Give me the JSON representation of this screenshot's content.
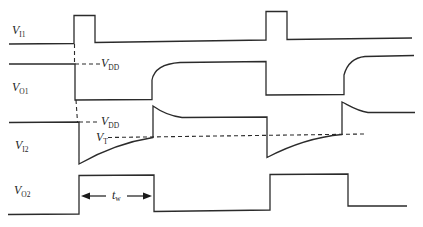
{
  "diagram": {
    "title": ""
  },
  "labels": {
    "vi1": {
      "main": "V",
      "sub": "I1"
    },
    "vo1": {
      "main": "V",
      "sub": "O1"
    },
    "vdd_1": {
      "main": "V",
      "sub": "DD"
    },
    "vi2": {
      "main": "V",
      "sub": "I2"
    },
    "vdd_2": {
      "main": "V",
      "sub": "DD"
    },
    "vt": {
      "main": "V",
      "sub": "T"
    },
    "vo2": {
      "main": "V",
      "sub": "O2"
    },
    "tw": {
      "main": "t",
      "sub": "w"
    }
  },
  "waveforms": {
    "vi1": {
      "path": "M9,44 L74,43.5 L74,15.5 L95,15.5 L95,42.5 L266,40 L266,11.5 L287,11.5 L287,39.5 L412,38"
    },
    "vo1": {
      "path": "M9,64 L75,64 L75,100 L152,99.5 L152,80 C154,69 164,63.5 180,62.5 L266,61.5 L266,95 L344,94.5 L344,75 C347,64 354,57.5 365,56.5 L414,55.5"
    },
    "vi2": {
      "path": "M9,122.5 L79,122 L79,164 C100,152 124,142 153,137.5 L153,106 C160,111 170,116 182,117.5 L267,117 L267,157.5 C289,146 314,137 342,134.5 L342,102 C350,106 357,111 368,112.5 L415,112.5"
    },
    "vo2": {
      "path": "M8,214.5 L79,214 L79,175.5 L154,175 L154,211.5 L270,210 L270,174.5 L348,174 L348,206 L407,206"
    }
  },
  "reference_lines": {
    "trigger_vertical_upper": {
      "path": "M74.5,44 L74.5,64"
    },
    "trigger_vertical_lower": {
      "path": "M76,100 L77.5,122"
    },
    "vdd_level_1": {
      "path": "M75,64 L100,64"
    },
    "vdd_level_2": {
      "path": "M79,122 L100,122"
    },
    "vt_threshold": {
      "path": "M108,137.5 L365,134"
    }
  },
  "tw_dimension": {
    "left_line": {
      "path": "M88,196 L106,196"
    },
    "left_head": {
      "points": "81,196 90,192.5 90,199.5"
    },
    "right_line": {
      "path": "M127,196 L145,196"
    },
    "right_head": {
      "points": "152,196 143,192.5 143,199.5"
    }
  }
}
